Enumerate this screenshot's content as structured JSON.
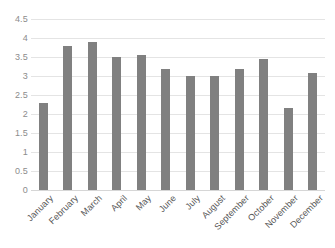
{
  "chart_data": {
    "type": "bar",
    "title": "",
    "subtitle": "",
    "xlabel": "",
    "ylabel": "",
    "categories": [
      "January",
      "February",
      "March",
      "April",
      "May",
      "June",
      "July",
      "August",
      "September",
      "October",
      "November",
      "December"
    ],
    "values": [
      2.3,
      3.8,
      3.9,
      3.5,
      3.55,
      3.18,
      3.0,
      3.0,
      3.18,
      3.45,
      2.17,
      3.08
    ],
    "series": [
      {
        "name": "",
        "values": [
          2.3,
          3.8,
          3.9,
          3.5,
          3.55,
          3.18,
          3.0,
          3.0,
          3.18,
          3.45,
          2.17,
          3.08
        ]
      }
    ],
    "ylim": [
      0,
      4.5
    ],
    "y_ticks": [
      0,
      0.5,
      1,
      1.5,
      2,
      2.5,
      3,
      3.5,
      4,
      4.5
    ],
    "y_tick_labels": [
      "0",
      "0.5",
      "1",
      "1.5",
      "2",
      "2.5",
      "3",
      "3.5",
      "4",
      "4.5"
    ],
    "grid": true,
    "grid_axis": "y",
    "legend": false,
    "legend_position": "none",
    "bar_color": "#808080",
    "grid_color": "#e4e4e4",
    "axis_text_color": "#8c8c8c",
    "category_text_color": "#555555",
    "background_color": "#ffffff",
    "x_label_rotation": -45,
    "annotations": []
  }
}
